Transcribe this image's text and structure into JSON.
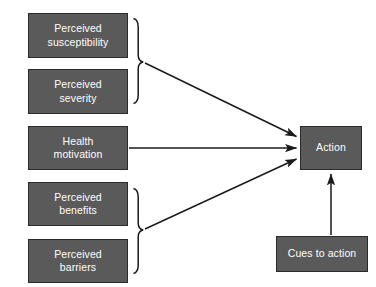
{
  "diagram": {
    "background_color": "#ffffff",
    "node_fill_color": "#5a5a5a",
    "node_border_color": "#2b2b2b",
    "node_text_color": "#ffffff",
    "connector_color": "#1a1a1a",
    "nodes": [
      {
        "id": "perceived-susceptibility",
        "label": "Perceived\nsusceptibility",
        "x": 28,
        "y": 13,
        "w": 100,
        "h": 45
      },
      {
        "id": "perceived-severity",
        "label": "Perceived\nseverity",
        "x": 28,
        "y": 69,
        "w": 100,
        "h": 45
      },
      {
        "id": "health-motivation",
        "label": "Health\nmotivation",
        "x": 28,
        "y": 126,
        "w": 100,
        "h": 44
      },
      {
        "id": "perceived-benefits",
        "label": "Perceived\nbenefits",
        "x": 28,
        "y": 182,
        "w": 100,
        "h": 44
      },
      {
        "id": "perceived-barriers",
        "label": "Perceived\nbarriers",
        "x": 28,
        "y": 239,
        "w": 100,
        "h": 44
      },
      {
        "id": "action",
        "label": "Action",
        "x": 300,
        "y": 126,
        "w": 62,
        "h": 44
      },
      {
        "id": "cues-to-action",
        "label": "Cues to action",
        "x": 276,
        "y": 236,
        "w": 92,
        "h": 36
      }
    ],
    "braces": [
      {
        "id": "brace-threat",
        "groups": [
          "perceived-susceptibility",
          "perceived-severity"
        ],
        "top": 18,
        "bottom": 104,
        "mid": 62,
        "x": 133
      },
      {
        "id": "brace-evaluation",
        "groups": [
          "perceived-benefits",
          "perceived-barriers"
        ],
        "top": 188,
        "bottom": 274,
        "mid": 230,
        "x": 133
      }
    ],
    "arrows": [
      {
        "id": "arrow-threat-to-action",
        "from": "brace-threat",
        "to": "action",
        "kind": "diagonal-down"
      },
      {
        "id": "arrow-motivation-to-action",
        "from": "health-motivation",
        "to": "action",
        "kind": "horizontal"
      },
      {
        "id": "arrow-evaluation-to-action",
        "from": "brace-evaluation",
        "to": "action",
        "kind": "diagonal-up"
      },
      {
        "id": "arrow-cues-to-action",
        "from": "cues-to-action",
        "to": "action",
        "kind": "vertical-up"
      }
    ]
  }
}
